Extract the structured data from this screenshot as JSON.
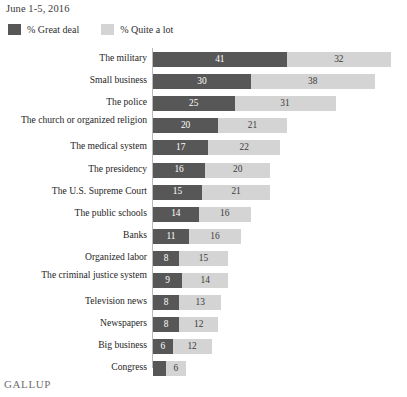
{
  "header": {
    "date_range": "June 1-5, 2016"
  },
  "legend": {
    "items": [
      {
        "label": "% Great deal",
        "color": "#575757",
        "key": "great_deal"
      },
      {
        "label": "% Quite a lot",
        "color": "#d4d4d4",
        "key": "quite_a_lot"
      }
    ]
  },
  "footer": {
    "logo": "GALLUP"
  },
  "colors": {
    "great_deal": "#575757",
    "quite_a_lot": "#d4d4d4",
    "axis": "#b9b9b9",
    "background": "#ffffff",
    "text": "#262626"
  },
  "chart_data": {
    "type": "bar",
    "orientation": "horizontal",
    "stacked": true,
    "title": "",
    "subtitle": "June 1-5, 2016",
    "xlabel": "",
    "ylabel": "",
    "xlim": [
      0,
      73
    ],
    "grid": false,
    "legend_position": "top-left",
    "categories": [
      "The military",
      "Small business",
      "The police",
      "The church or organized religion",
      "The medical system",
      "The presidency",
      "The U.S. Supreme Court",
      "The public schools",
      "Banks",
      "Organized labor",
      "The criminal justice system",
      "Television news",
      "Newspapers",
      "Big business",
      "Congress"
    ],
    "series": [
      {
        "name": "% Great deal",
        "color": "#575757",
        "values": [
          41,
          30,
          25,
          20,
          17,
          16,
          15,
          14,
          11,
          8,
          9,
          8,
          8,
          6,
          4
        ]
      },
      {
        "name": "% Quite a lot",
        "color": "#d4d4d4",
        "values": [
          32,
          38,
          31,
          21,
          22,
          20,
          21,
          16,
          16,
          15,
          14,
          13,
          12,
          12,
          6
        ]
      }
    ],
    "rows": [
      {
        "label": "The military",
        "great_deal": 41,
        "great_deal_label": "41",
        "quite_a_lot": 32,
        "quite_a_lot_label": "32",
        "total": 73
      },
      {
        "label": "Small business",
        "great_deal": 30,
        "great_deal_label": "30",
        "quite_a_lot": 38,
        "quite_a_lot_label": "38",
        "total": 68
      },
      {
        "label": "The police",
        "great_deal": 25,
        "great_deal_label": "25",
        "quite_a_lot": 31,
        "quite_a_lot_label": "31",
        "total": 56
      },
      {
        "label": "The church or organized religion",
        "great_deal": 20,
        "great_deal_label": "20",
        "quite_a_lot": 21,
        "quite_a_lot_label": "21",
        "total": 41
      },
      {
        "label": "The medical system",
        "great_deal": 17,
        "great_deal_label": "17",
        "quite_a_lot": 22,
        "quite_a_lot_label": "22",
        "total": 39
      },
      {
        "label": "The presidency",
        "great_deal": 16,
        "great_deal_label": "16",
        "quite_a_lot": 20,
        "quite_a_lot_label": "20",
        "total": 36
      },
      {
        "label": "The U.S. Supreme Court",
        "great_deal": 15,
        "great_deal_label": "15",
        "quite_a_lot": 21,
        "quite_a_lot_label": "21",
        "total": 36
      },
      {
        "label": "The public schools",
        "great_deal": 14,
        "great_deal_label": "14",
        "quite_a_lot": 16,
        "quite_a_lot_label": "16",
        "total": 30
      },
      {
        "label": "Banks",
        "great_deal": 11,
        "great_deal_label": "11",
        "quite_a_lot": 16,
        "quite_a_lot_label": "16",
        "total": 27
      },
      {
        "label": "Organized labor",
        "great_deal": 8,
        "great_deal_label": "8",
        "quite_a_lot": 15,
        "quite_a_lot_label": "15",
        "total": 23
      },
      {
        "label": "The criminal justice system",
        "great_deal": 9,
        "great_deal_label": "9",
        "quite_a_lot": 14,
        "quite_a_lot_label": "14",
        "total": 23
      },
      {
        "label": "Television news",
        "great_deal": 8,
        "great_deal_label": "8",
        "quite_a_lot": 13,
        "quite_a_lot_label": "13",
        "total": 21
      },
      {
        "label": "Newspapers",
        "great_deal": 8,
        "great_deal_label": "8",
        "quite_a_lot": 12,
        "quite_a_lot_label": "12",
        "total": 20
      },
      {
        "label": "Big business",
        "great_deal": 6,
        "great_deal_label": "6",
        "quite_a_lot": 12,
        "quite_a_lot_label": "12",
        "total": 18
      },
      {
        "label": "Congress",
        "great_deal": 4,
        "great_deal_label": "",
        "quite_a_lot": 6,
        "quite_a_lot_label": "6",
        "total": 10
      }
    ]
  }
}
